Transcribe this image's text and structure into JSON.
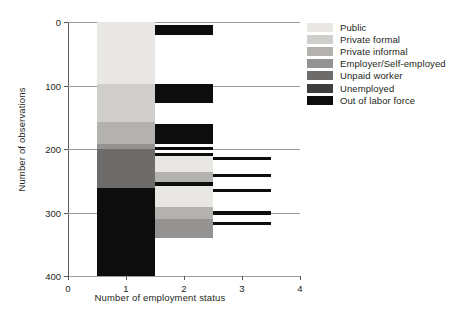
{
  "chart_data": {
    "type": "bar",
    "title": "",
    "xlabel": "Number of employment status",
    "ylabel": "Number of observations",
    "xlim": [
      0,
      4
    ],
    "ylim": [
      0,
      400
    ],
    "y_inverted": true,
    "grid": true,
    "legend_position": "right",
    "xticks": [
      "0",
      "1",
      "2",
      "3",
      "4"
    ],
    "xtick_values": [
      0,
      1,
      2,
      3,
      4
    ],
    "yticks": [
      "0",
      "100",
      "200",
      "300",
      "400"
    ],
    "ytick_values": [
      0,
      100,
      200,
      300,
      400
    ],
    "categories": [
      "1",
      "2",
      "3"
    ],
    "series": [
      {
        "name": "Public",
        "color": "#e8e7e4",
        "values": [
          100,
          33,
          0
        ]
      },
      {
        "name": "Private formal",
        "color": "#cfcecb",
        "values": [
          60,
          25,
          0
        ]
      },
      {
        "name": "Private informal",
        "color": "#b3b2af",
        "values": [
          35,
          44,
          0
        ]
      },
      {
        "name": "Employer/Self-employed",
        "color": "#949391",
        "values": [
          8,
          18,
          0
        ]
      },
      {
        "name": "Unpaid worker",
        "color": "#6d6c6b",
        "values": [
          62,
          0,
          0
        ]
      },
      {
        "name": "Unemployed",
        "color": "#3f3e3e",
        "values": [
          0,
          0,
          0
        ]
      },
      {
        "name": "Out of labor force",
        "color": "#0d0d0d",
        "values": [
          135,
          48,
          10
        ]
      }
    ],
    "stacks": [
      {
        "x": 1,
        "segments": [
          {
            "name": "Public",
            "color": "#e8e7e4",
            "start": 0,
            "end": 97
          },
          {
            "name": "Private formal",
            "color": "#cfcecb",
            "start": 97,
            "end": 157
          },
          {
            "name": "Private informal",
            "color": "#b3b2af",
            "start": 157,
            "end": 192
          },
          {
            "name": "Employer/Self-employed",
            "color": "#949391",
            "start": 192,
            "end": 200
          },
          {
            "name": "Unpaid worker",
            "color": "#6d6c6b",
            "start": 200,
            "end": 262
          },
          {
            "name": "Out of labor force",
            "color": "#0d0d0d",
            "start": 262,
            "end": 400
          }
        ]
      },
      {
        "x": 2,
        "segments": [
          {
            "name": "Out of labor force",
            "color": "#0d0d0d",
            "start": 5,
            "end": 20
          },
          {
            "name": "Out of labor force",
            "color": "#0d0d0d",
            "start": 97,
            "end": 127
          },
          {
            "name": "Out of labor force",
            "color": "#0d0d0d",
            "start": 160,
            "end": 192
          },
          {
            "name": "Out of labor force",
            "color": "#0d0d0d",
            "start": 197,
            "end": 201
          },
          {
            "name": "Out of labor force",
            "color": "#0d0d0d",
            "start": 206,
            "end": 211
          },
          {
            "name": "Public",
            "color": "#e8e7e4",
            "start": 211,
            "end": 237
          },
          {
            "name": "Private informal",
            "color": "#b3b2af",
            "start": 237,
            "end": 252
          },
          {
            "name": "Out of labor force",
            "color": "#0d0d0d",
            "start": 252,
            "end": 259
          },
          {
            "name": "Public",
            "color": "#e8e7e4",
            "start": 259,
            "end": 292
          },
          {
            "name": "Private informal",
            "color": "#b3b2af",
            "start": 292,
            "end": 311
          },
          {
            "name": "Employer/Self-employed",
            "color": "#949391",
            "start": 311,
            "end": 340
          }
        ]
      },
      {
        "x": 3,
        "segments": [
          {
            "name": "Out of labor force",
            "color": "#0d0d0d",
            "start": 212,
            "end": 217
          },
          {
            "name": "Out of labor force",
            "color": "#0d0d0d",
            "start": 239,
            "end": 244
          },
          {
            "name": "Out of labor force",
            "color": "#0d0d0d",
            "start": 263,
            "end": 268
          },
          {
            "name": "Out of labor force",
            "color": "#0d0d0d",
            "start": 297,
            "end": 304
          },
          {
            "name": "Out of labor force",
            "color": "#0d0d0d",
            "start": 315,
            "end": 320
          }
        ]
      }
    ],
    "legend_entries": [
      {
        "label": "Public",
        "color": "#e8e7e4"
      },
      {
        "label": "Private formal",
        "color": "#cfcecb"
      },
      {
        "label": "Private informal",
        "color": "#b3b2af"
      },
      {
        "label": "Employer/Self-employed",
        "color": "#949391"
      },
      {
        "label": "Unpaid worker",
        "color": "#6d6c6b"
      },
      {
        "label": "Unemployed",
        "color": "#3f3e3e"
      },
      {
        "label": "Out of labor force",
        "color": "#0d0d0d"
      }
    ]
  }
}
